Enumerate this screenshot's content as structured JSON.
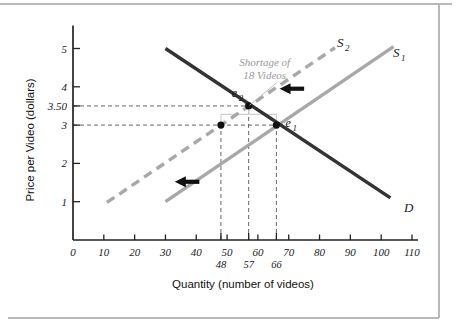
{
  "figure": {
    "background_color": "#ffffff",
    "border_color": "#b9b9b9"
  },
  "chart_data": {
    "type": "line",
    "title": "",
    "xlabel": "Quantity (number of videos)",
    "ylabel": "Price per Video (dollars)",
    "xlim": [
      0,
      110
    ],
    "ylim": [
      0,
      5.6
    ],
    "grid": false,
    "legend_position": "inline-curve-labels",
    "x_ticks": [
      0,
      10,
      20,
      30,
      40,
      50,
      60,
      70,
      80,
      90,
      100,
      110
    ],
    "x_tick_labels": [
      "0",
      "10",
      "20",
      "30",
      "40",
      "50",
      "60",
      "70",
      "80",
      "90",
      "100",
      "110"
    ],
    "x_special_ticks": [
      48,
      57,
      66
    ],
    "x_special_tick_labels": [
      "48",
      "57",
      "66"
    ],
    "y_ticks": [
      1,
      2,
      3,
      3.5,
      4,
      5
    ],
    "y_tick_labels": [
      "1",
      "2",
      "3",
      "3.50",
      "4",
      "5"
    ],
    "series": [
      {
        "name": "S1",
        "label": "S",
        "label_sub": "1",
        "role": "supply-original",
        "style": "solid",
        "color": "#a8a8a8",
        "points": [
          [
            30,
            1
          ],
          [
            104,
            5.05
          ]
        ]
      },
      {
        "name": "S2",
        "label": "S",
        "label_sub": "2",
        "role": "supply-shifted",
        "style": "dashed",
        "color": "#a8a8a8",
        "points": [
          [
            11,
            0.98
          ],
          [
            85,
            5.02
          ]
        ]
      },
      {
        "name": "D",
        "label": "D",
        "label_sub": "",
        "role": "demand",
        "style": "solid",
        "color": "#333333",
        "points": [
          [
            30,
            5.0
          ],
          [
            103,
            1.1
          ]
        ]
      }
    ],
    "points": [
      {
        "name": "e2",
        "label": "e",
        "label_sub": "2",
        "x": 57,
        "y": 3.5,
        "color": "#111111"
      },
      {
        "name": "e1",
        "label": "e",
        "label_sub": "1",
        "x": 66,
        "y": 3.0,
        "color": "#111111"
      },
      {
        "name": "quantity-supplied-at-3",
        "label": "",
        "label_sub": "",
        "x": 48,
        "y": 3.0,
        "color": "#111111"
      }
    ],
    "annotations": [
      {
        "name": "shortage-annotation",
        "line1": "Shortage of",
        "line2": "18 Videos",
        "color": "#9a9a9a",
        "x": 57,
        "y": 4.55
      }
    ],
    "arrows": [
      {
        "name": "shift-arrow-upper",
        "direction": "left",
        "x_from": 75,
        "x_to": 68,
        "y": 3.95
      },
      {
        "name": "shift-arrow-lower",
        "direction": "left",
        "x_from": 41,
        "x_to": 34,
        "y": 1.52
      }
    ],
    "guide_lines": [
      {
        "name": "price-guide-3-50",
        "orientation": "horizontal",
        "value": 3.5,
        "to_x": 57
      },
      {
        "name": "price-guide-3-00",
        "orientation": "horizontal",
        "value": 3.0,
        "to_x": 66
      },
      {
        "name": "quantity-guide-48",
        "orientation": "vertical",
        "value": 48,
        "to_y": 3.0
      },
      {
        "name": "quantity-guide-57",
        "orientation": "vertical",
        "value": 57,
        "to_y": 3.5
      },
      {
        "name": "quantity-guide-66",
        "orientation": "vertical",
        "value": 66,
        "to_y": 3.0
      }
    ]
  }
}
